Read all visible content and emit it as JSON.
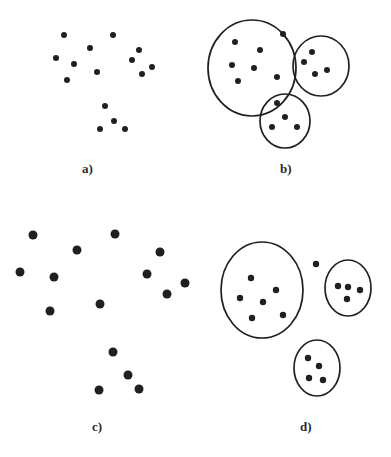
{
  "figure": {
    "width": 391,
    "height": 457,
    "background_color": "#ffffff",
    "dot_color": "#231f20",
    "ellipse_stroke_color": "#231f20",
    "caption_color": "#2b2b2b"
  },
  "panels": [
    {
      "id": "a",
      "caption": "a)",
      "caption_x": 82,
      "caption_y": 161,
      "description": "Scatter of unlabeled data points, small dots",
      "dot_radius": 3.0,
      "ellipses": [],
      "points": [
        [
          64,
          35
        ],
        [
          113,
          35
        ],
        [
          90,
          48
        ],
        [
          56,
          58
        ],
        [
          74,
          64
        ],
        [
          139,
          50
        ],
        [
          132,
          60
        ],
        [
          152,
          67
        ],
        [
          142,
          74
        ],
        [
          97,
          72
        ],
        [
          67,
          80
        ],
        [
          105,
          106
        ],
        [
          114,
          121
        ],
        [
          100,
          129
        ],
        [
          125,
          129
        ]
      ]
    },
    {
      "id": "b",
      "caption": "b)",
      "caption_x": 280,
      "caption_y": 161,
      "description": "Same scatter with three clusters circled by ellipses, one outlier point outside",
      "dot_radius": 3.0,
      "ellipses": [
        {
          "cx": 252,
          "cy": 68,
          "rx": 44,
          "ry": 48,
          "rotation": 0
        },
        {
          "cx": 321,
          "cy": 66,
          "rx": 28,
          "ry": 30,
          "rotation": 0
        },
        {
          "cx": 285,
          "cy": 121,
          "rx": 25,
          "ry": 27,
          "rotation": 0
        }
      ],
      "points": [
        [
          235,
          42
        ],
        [
          260,
          50
        ],
        [
          232,
          65
        ],
        [
          254,
          68
        ],
        [
          277,
          77
        ],
        [
          238,
          81
        ],
        [
          283,
          34
        ],
        [
          312,
          52
        ],
        [
          304,
          62
        ],
        [
          327,
          70
        ],
        [
          315,
          74
        ],
        [
          277,
          103
        ],
        [
          285,
          117
        ],
        [
          272,
          127
        ],
        [
          297,
          127
        ]
      ]
    },
    {
      "id": "c",
      "caption": "c)",
      "caption_x": 92,
      "caption_y": 419,
      "description": "Scatter of unlabeled data points, larger dots",
      "dot_radius": 4.5,
      "ellipses": [],
      "points": [
        [
          33,
          235
        ],
        [
          115,
          234
        ],
        [
          77,
          250
        ],
        [
          20,
          272
        ],
        [
          54,
          277
        ],
        [
          160,
          252
        ],
        [
          147,
          274
        ],
        [
          185,
          283
        ],
        [
          167,
          294
        ],
        [
          100,
          304
        ],
        [
          50,
          311
        ],
        [
          113,
          352
        ],
        [
          128,
          375
        ],
        [
          99,
          390
        ],
        [
          139,
          389
        ]
      ]
    },
    {
      "id": "d",
      "caption": "d)",
      "caption_x": 300,
      "caption_y": 419,
      "description": "Clusters circled by ellipses with points compacted inside, one outlier point outside",
      "dot_radius": 3.2,
      "ellipses": [
        {
          "cx": 262,
          "cy": 290,
          "rx": 41,
          "ry": 48,
          "rotation": 0
        },
        {
          "cx": 348,
          "cy": 288,
          "rx": 23,
          "ry": 28,
          "rotation": 0
        },
        {
          "cx": 317,
          "cy": 368,
          "rx": 23,
          "ry": 28,
          "rotation": 0
        }
      ],
      "points": [
        [
          251,
          278
        ],
        [
          276,
          290
        ],
        [
          240,
          298
        ],
        [
          263,
          302
        ],
        [
          283,
          315
        ],
        [
          252,
          318
        ],
        [
          316,
          264
        ],
        [
          338,
          286
        ],
        [
          348,
          287
        ],
        [
          360,
          290
        ],
        [
          347,
          299
        ],
        [
          308,
          358
        ],
        [
          319,
          366
        ],
        [
          309,
          378
        ],
        [
          323,
          380
        ]
      ]
    }
  ]
}
